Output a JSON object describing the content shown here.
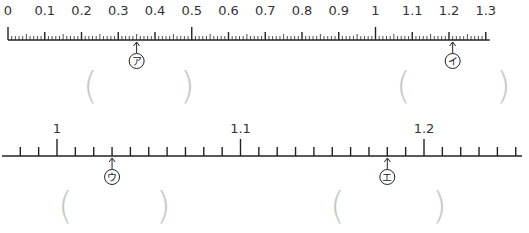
{
  "top_ruler": {
    "start": 0,
    "end": 1.3,
    "major_labels": [
      "0",
      "0.1",
      "0.2",
      "0.3",
      "0.4",
      "0.5",
      "0.6",
      "0.7",
      "0.8",
      "0.9",
      "1",
      "1.1",
      "1.2",
      "1.3"
    ],
    "minor_step": 0.01,
    "pointers": [
      {
        "id": "a",
        "label": "ア",
        "value": 0.35
      },
      {
        "id": "i",
        "label": "イ",
        "value": 1.21
      }
    ]
  },
  "bottom_ruler": {
    "start": 0.99,
    "end": 1.25,
    "major_labels": [
      "1",
      "1.1",
      "1.2"
    ],
    "minor_step": 0.01,
    "pointers": [
      {
        "id": "u",
        "label": "ウ",
        "value": 1.03
      },
      {
        "id": "e",
        "label": "エ",
        "value": 1.18
      }
    ]
  },
  "answer_boxes": [
    {
      "id": "a",
      "open": "(",
      "close": ")"
    },
    {
      "id": "i",
      "open": "(",
      "close": ")"
    },
    {
      "id": "u",
      "open": "(",
      "close": ")"
    },
    {
      "id": "e",
      "open": "(",
      "close": ")"
    }
  ],
  "colors": {
    "line": "#222222",
    "paren": "#c8c8c8"
  }
}
